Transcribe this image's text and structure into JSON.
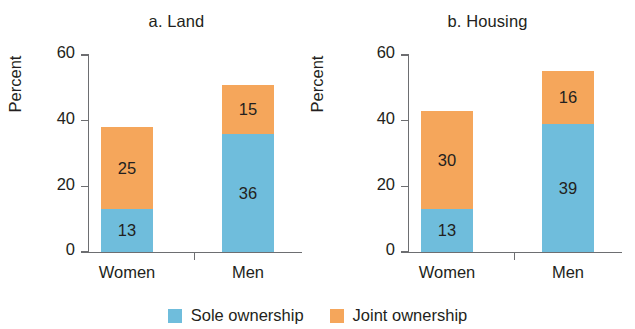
{
  "chart_data": [
    {
      "type": "bar",
      "id": "land",
      "title": "a. Land",
      "xlabel": "",
      "ylabel": "Percent",
      "ylim": [
        0,
        60
      ],
      "yticks": [
        0,
        20,
        40,
        60
      ],
      "ytick_labels": [
        "0",
        "20",
        "40",
        "60"
      ],
      "grid": false,
      "stacked": true,
      "legend_position": "bottom-center",
      "categories": [
        "Women",
        "Men"
      ],
      "series": [
        {
          "name": "Sole ownership",
          "color": "#6fbddc",
          "values": [
            13,
            36
          ]
        },
        {
          "name": "Joint ownership",
          "color": "#f5a65b",
          "values": [
            25,
            15
          ]
        }
      ],
      "totals": [
        38,
        51
      ]
    },
    {
      "type": "bar",
      "id": "housing",
      "title": "b. Housing",
      "xlabel": "",
      "ylabel": "Percent",
      "ylim": [
        0,
        60
      ],
      "yticks": [
        0,
        20,
        40,
        60
      ],
      "ytick_labels": [
        "0",
        "20",
        "40",
        "60"
      ],
      "grid": false,
      "stacked": true,
      "legend_position": "bottom-center",
      "categories": [
        "Women",
        "Men"
      ],
      "series": [
        {
          "name": "Sole ownership",
          "color": "#6fbddc",
          "values": [
            13,
            39
          ]
        },
        {
          "name": "Joint ownership",
          "color": "#f5a65b",
          "values": [
            30,
            16
          ]
        }
      ],
      "totals": [
        43,
        55
      ]
    }
  ],
  "legend": {
    "items": [
      {
        "label": "Sole ownership",
        "color": "#6fbddc"
      },
      {
        "label": "Joint ownership",
        "color": "#f5a65b"
      }
    ]
  },
  "colors": {
    "sole": "#6fbddc",
    "joint": "#f5a65b",
    "axis": "#6d6e71",
    "text": "#231f20",
    "background": "#ffffff"
  }
}
